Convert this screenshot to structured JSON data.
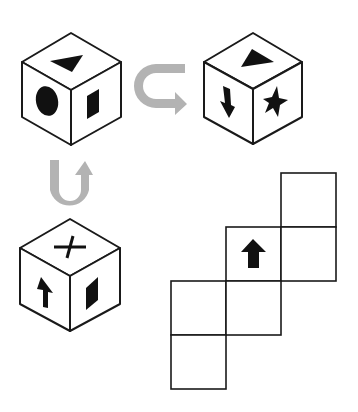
{
  "puzzle": {
    "type": "cube-folding",
    "cubes": [
      {
        "id": 1,
        "faces": {
          "top": "triangle",
          "left": "ellipse",
          "right": "square"
        }
      },
      {
        "id": 2,
        "faces": {
          "top": "triangle",
          "left": "arrow-down",
          "right": "star"
        }
      },
      {
        "id": 3,
        "faces": {
          "top": "cross",
          "left": "arrow-up",
          "right": "square"
        }
      }
    ],
    "transitions": [
      {
        "from": 1,
        "to": 2,
        "icon": "u-turn-right-arrow",
        "color": "#b3b3b3"
      },
      {
        "from": 3,
        "to": 1,
        "icon": "u-turn-up-arrow",
        "color": "#b3b3b3"
      }
    ],
    "net": {
      "cells": [
        {
          "row": 0,
          "col": 2,
          "symbol": ""
        },
        {
          "row": 1,
          "col": 1,
          "symbol": "arrow-up"
        },
        {
          "row": 1,
          "col": 2,
          "symbol": ""
        },
        {
          "row": 2,
          "col": 0,
          "symbol": ""
        },
        {
          "row": 2,
          "col": 1,
          "symbol": ""
        },
        {
          "row": 3,
          "col": 0,
          "symbol": ""
        }
      ]
    }
  }
}
